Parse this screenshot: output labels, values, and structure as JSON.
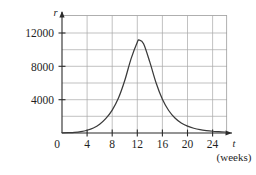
{
  "chart_data": {
    "type": "line",
    "title": "",
    "subtitle": "",
    "xlabel": "t",
    "xlabel_unit": "(weeks)",
    "ylabel": "r",
    "xlim": [
      0,
      26
    ],
    "ylim": [
      0,
      13000
    ],
    "grid": true,
    "legend_position": "none",
    "x_ticks": [
      0,
      4,
      8,
      12,
      16,
      20,
      24
    ],
    "x_tick_labels": [
      "0",
      "4",
      "8",
      "12",
      "16",
      "20",
      "24"
    ],
    "y_ticks": [
      0,
      4000,
      8000,
      12000
    ],
    "y_tick_labels": [
      "0",
      "4000",
      "8000",
      "12000"
    ],
    "y_gridlines": [
      2000,
      4000,
      6000,
      8000,
      10000,
      12000
    ],
    "x_gridlines": [
      4,
      8,
      12,
      16,
      20,
      24
    ],
    "series": [
      {
        "name": "r",
        "color": "#3a3a3a",
        "x": [
          0,
          1,
          2,
          3,
          4,
          5,
          6,
          7,
          8,
          9,
          10,
          11,
          12,
          12.3,
          13,
          14,
          15,
          16,
          17,
          18,
          19,
          20,
          21,
          22,
          23,
          24,
          25,
          26
        ],
        "y": [
          20,
          40,
          80,
          170,
          330,
          600,
          1050,
          1750,
          2750,
          4200,
          6300,
          8900,
          10900,
          11150,
          10700,
          8500,
          6000,
          4050,
          2700,
          1800,
          1200,
          820,
          570,
          400,
          290,
          210,
          160,
          120
        ]
      }
    ],
    "annotations": []
  },
  "figure": {
    "axis_arrow_x": "arrow-right",
    "axis_arrow_y": "arrow-up"
  }
}
